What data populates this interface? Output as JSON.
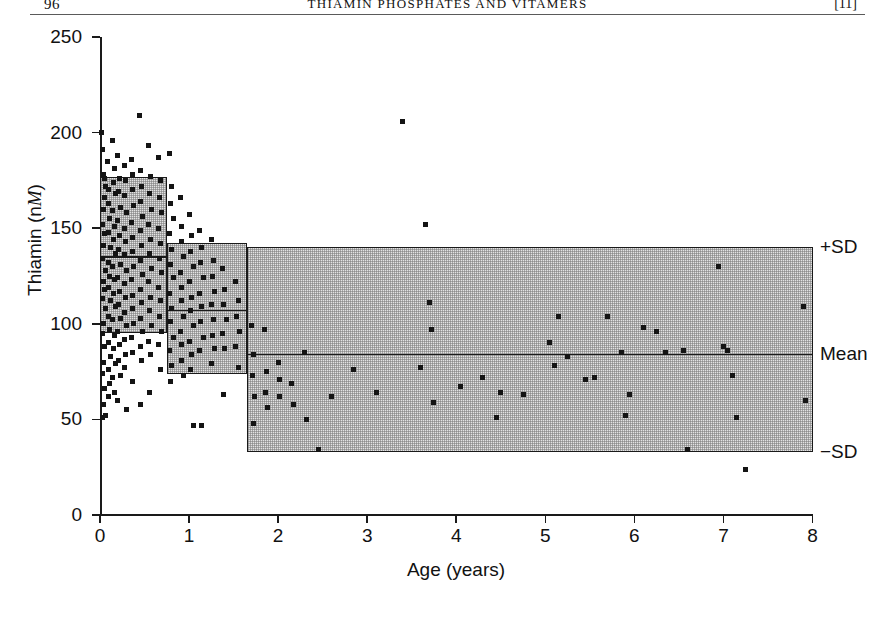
{
  "running_head": {
    "folio": "96",
    "title": "THIAMIN PHOSPHATES AND VITAMERS",
    "bracket": "[11]"
  },
  "chart_data": {
    "type": "scatter",
    "title": "",
    "xlabel": "Age (years)",
    "ylabel": "Thiamin (nM)",
    "ylabel_prefix": "Thiamin (n",
    "ylabel_italic": "M",
    "ylabel_suffix": ")",
    "xlim": [
      0,
      8
    ],
    "ylim": [
      0,
      250
    ],
    "xticks": [
      0,
      1,
      2,
      3,
      4,
      5,
      6,
      7,
      8
    ],
    "yticks": [
      0,
      50,
      100,
      150,
      200,
      250
    ],
    "xtick_labels": [
      "0",
      "1",
      "2",
      "3",
      "4",
      "5",
      "6",
      "7",
      "8"
    ],
    "ytick_labels": [
      "0",
      "50",
      "100",
      "150",
      "200",
      "250"
    ],
    "grid": false,
    "legend_position": "right-outside",
    "annotations": [
      {
        "label": "+SD",
        "y": 140
      },
      {
        "label": "Mean",
        "y": 84
      },
      {
        "label": "−SD",
        "y": 33
      }
    ],
    "reference_bands": [
      {
        "name": "band-0-to-0.75y",
        "x_start": 0.0,
        "x_end": 0.75,
        "plus_sd": 177,
        "mean": 135,
        "minus_sd": 95
      },
      {
        "name": "band-0.75-to-1.65y",
        "x_start": 0.75,
        "x_end": 1.65,
        "plus_sd": 142,
        "mean": 107,
        "minus_sd": 74
      },
      {
        "name": "band-1.65-to-8y",
        "x_start": 1.65,
        "x_end": 8.0,
        "plus_sd": 140,
        "mean": 84,
        "minus_sd": 33
      }
    ],
    "series": [
      {
        "name": "Thiamin concentration",
        "marker": "square",
        "color": "#141414",
        "points": [
          [
            0.02,
            200
          ],
          [
            0.03,
            191
          ],
          [
            0.04,
            178
          ],
          [
            0.05,
            176
          ],
          [
            0.06,
            172
          ],
          [
            0.05,
            166
          ],
          [
            0.04,
            160
          ],
          [
            0.03,
            152
          ],
          [
            0.05,
            147
          ],
          [
            0.04,
            141
          ],
          [
            0.03,
            134
          ],
          [
            0.06,
            128
          ],
          [
            0.04,
            122
          ],
          [
            0.05,
            118
          ],
          [
            0.03,
            113
          ],
          [
            0.06,
            108
          ],
          [
            0.04,
            100
          ],
          [
            0.03,
            95
          ],
          [
            0.05,
            88
          ],
          [
            0.04,
            80
          ],
          [
            0.03,
            74
          ],
          [
            0.05,
            66
          ],
          [
            0.04,
            58
          ],
          [
            0.06,
            52
          ],
          [
            0.03,
            51
          ],
          [
            0.08,
            185
          ],
          [
            0.09,
            170
          ],
          [
            0.1,
            163
          ],
          [
            0.11,
            155
          ],
          [
            0.09,
            148
          ],
          [
            0.12,
            140
          ],
          [
            0.1,
            132
          ],
          [
            0.11,
            125
          ],
          [
            0.09,
            119
          ],
          [
            0.12,
            112
          ],
          [
            0.1,
            104
          ],
          [
            0.11,
            97
          ],
          [
            0.09,
            90
          ],
          [
            0.12,
            83
          ],
          [
            0.1,
            76
          ],
          [
            0.11,
            69
          ],
          [
            0.09,
            62
          ],
          [
            0.14,
            196
          ],
          [
            0.16,
            181
          ],
          [
            0.15,
            174
          ],
          [
            0.17,
            168
          ],
          [
            0.14,
            159
          ],
          [
            0.16,
            151
          ],
          [
            0.15,
            144
          ],
          [
            0.17,
            137
          ],
          [
            0.14,
            130
          ],
          [
            0.16,
            123
          ],
          [
            0.15,
            116
          ],
          [
            0.17,
            109
          ],
          [
            0.14,
            102
          ],
          [
            0.16,
            94
          ],
          [
            0.15,
            87
          ],
          [
            0.17,
            79
          ],
          [
            0.14,
            72
          ],
          [
            0.16,
            64
          ],
          [
            0.2,
            188
          ],
          [
            0.22,
            176
          ],
          [
            0.21,
            169
          ],
          [
            0.23,
            161
          ],
          [
            0.2,
            154
          ],
          [
            0.22,
            146
          ],
          [
            0.21,
            139
          ],
          [
            0.23,
            131
          ],
          [
            0.2,
            124
          ],
          [
            0.22,
            117
          ],
          [
            0.21,
            110
          ],
          [
            0.23,
            103
          ],
          [
            0.2,
            96
          ],
          [
            0.22,
            89
          ],
          [
            0.21,
            81
          ],
          [
            0.23,
            73
          ],
          [
            0.2,
            60
          ],
          [
            0.27,
            183
          ],
          [
            0.29,
            175
          ],
          [
            0.28,
            167
          ],
          [
            0.3,
            158
          ],
          [
            0.27,
            150
          ],
          [
            0.29,
            143
          ],
          [
            0.28,
            136
          ],
          [
            0.3,
            128
          ],
          [
            0.27,
            121
          ],
          [
            0.29,
            114
          ],
          [
            0.28,
            106
          ],
          [
            0.3,
            99
          ],
          [
            0.27,
            92
          ],
          [
            0.29,
            84
          ],
          [
            0.28,
            77
          ],
          [
            0.3,
            55
          ],
          [
            0.35,
            186
          ],
          [
            0.37,
            178
          ],
          [
            0.36,
            170
          ],
          [
            0.38,
            162
          ],
          [
            0.35,
            153
          ],
          [
            0.37,
            145
          ],
          [
            0.36,
            138
          ],
          [
            0.38,
            130
          ],
          [
            0.35,
            123
          ],
          [
            0.37,
            115
          ],
          [
            0.36,
            108
          ],
          [
            0.38,
            100
          ],
          [
            0.35,
            93
          ],
          [
            0.37,
            85
          ],
          [
            0.36,
            70
          ],
          [
            0.44,
            209
          ],
          [
            0.45,
            180
          ],
          [
            0.47,
            172
          ],
          [
            0.46,
            164
          ],
          [
            0.48,
            156
          ],
          [
            0.45,
            149
          ],
          [
            0.47,
            141
          ],
          [
            0.46,
            133
          ],
          [
            0.48,
            126
          ],
          [
            0.45,
            118
          ],
          [
            0.47,
            111
          ],
          [
            0.46,
            103
          ],
          [
            0.48,
            96
          ],
          [
            0.45,
            88
          ],
          [
            0.47,
            81
          ],
          [
            0.46,
            58
          ],
          [
            0.55,
            193
          ],
          [
            0.57,
            177
          ],
          [
            0.56,
            168
          ],
          [
            0.58,
            160
          ],
          [
            0.55,
            152
          ],
          [
            0.57,
            144
          ],
          [
            0.56,
            137
          ],
          [
            0.58,
            129
          ],
          [
            0.55,
            122
          ],
          [
            0.57,
            114
          ],
          [
            0.56,
            107
          ],
          [
            0.58,
            99
          ],
          [
            0.55,
            91
          ],
          [
            0.57,
            84
          ],
          [
            0.56,
            64
          ],
          [
            0.66,
            187
          ],
          [
            0.68,
            175
          ],
          [
            0.67,
            166
          ],
          [
            0.69,
            158
          ],
          [
            0.66,
            150
          ],
          [
            0.68,
            142
          ],
          [
            0.67,
            134
          ],
          [
            0.69,
            127
          ],
          [
            0.66,
            119
          ],
          [
            0.68,
            112
          ],
          [
            0.67,
            104
          ],
          [
            0.69,
            96
          ],
          [
            0.66,
            89
          ],
          [
            0.68,
            76
          ],
          [
            0.78,
            189
          ],
          [
            0.8,
            172
          ],
          [
            0.79,
            163
          ],
          [
            0.82,
            155
          ],
          [
            0.78,
            147
          ],
          [
            0.8,
            139
          ],
          [
            0.79,
            131
          ],
          [
            0.82,
            124
          ],
          [
            0.78,
            116
          ],
          [
            0.8,
            108
          ],
          [
            0.79,
            101
          ],
          [
            0.82,
            93
          ],
          [
            0.78,
            86
          ],
          [
            0.8,
            78
          ],
          [
            0.79,
            70
          ],
          [
            0.9,
            166
          ],
          [
            0.92,
            151
          ],
          [
            0.91,
            143
          ],
          [
            0.94,
            135
          ],
          [
            0.9,
            127
          ],
          [
            0.92,
            119
          ],
          [
            0.91,
            112
          ],
          [
            0.94,
            104
          ],
          [
            0.9,
            96
          ],
          [
            0.92,
            89
          ],
          [
            0.91,
            81
          ],
          [
            0.94,
            73
          ],
          [
            1.0,
            157
          ],
          [
            1.03,
            146
          ],
          [
            1.02,
            138
          ],
          [
            1.05,
            130
          ],
          [
            1.0,
            122
          ],
          [
            1.03,
            114
          ],
          [
            1.02,
            107
          ],
          [
            1.05,
            99
          ],
          [
            1.0,
            91
          ],
          [
            1.03,
            84
          ],
          [
            1.02,
            76
          ],
          [
            1.05,
            47
          ],
          [
            1.12,
            149
          ],
          [
            1.14,
            140
          ],
          [
            1.13,
            132
          ],
          [
            1.16,
            124
          ],
          [
            1.12,
            116
          ],
          [
            1.14,
            109
          ],
          [
            1.13,
            101
          ],
          [
            1.16,
            93
          ],
          [
            1.12,
            86
          ],
          [
            1.14,
            47
          ],
          [
            1.25,
            144
          ],
          [
            1.27,
            133
          ],
          [
            1.26,
            125
          ],
          [
            1.29,
            117
          ],
          [
            1.25,
            110
          ],
          [
            1.27,
            102
          ],
          [
            1.26,
            94
          ],
          [
            1.29,
            87
          ],
          [
            1.25,
            79
          ],
          [
            1.38,
            129
          ],
          [
            1.4,
            118
          ],
          [
            1.39,
            110
          ],
          [
            1.42,
            102
          ],
          [
            1.38,
            95
          ],
          [
            1.4,
            87
          ],
          [
            1.39,
            63
          ],
          [
            1.52,
            122
          ],
          [
            1.55,
            112
          ],
          [
            1.53,
            104
          ],
          [
            1.57,
            96
          ],
          [
            1.52,
            88
          ],
          [
            1.55,
            77
          ],
          [
            1.7,
            99
          ],
          [
            1.72,
            84
          ],
          [
            1.71,
            73
          ],
          [
            1.73,
            62
          ],
          [
            1.72,
            48
          ],
          [
            1.85,
            97
          ],
          [
            1.87,
            75
          ],
          [
            1.86,
            64
          ],
          [
            1.88,
            56
          ],
          [
            2.0,
            80
          ],
          [
            2.02,
            71
          ],
          [
            2.01,
            62
          ],
          [
            2.15,
            69
          ],
          [
            2.17,
            58
          ],
          [
            2.3,
            85
          ],
          [
            2.32,
            50
          ],
          [
            2.45,
            34
          ],
          [
            2.6,
            62
          ],
          [
            2.85,
            76
          ],
          [
            3.1,
            64
          ],
          [
            3.4,
            206
          ],
          [
            3.6,
            77
          ],
          [
            3.65,
            152
          ],
          [
            3.7,
            111
          ],
          [
            3.72,
            97
          ],
          [
            3.75,
            59
          ],
          [
            4.05,
            67
          ],
          [
            4.3,
            72
          ],
          [
            4.45,
            51
          ],
          [
            4.5,
            64
          ],
          [
            4.75,
            63
          ],
          [
            5.05,
            90
          ],
          [
            5.1,
            78
          ],
          [
            5.15,
            104
          ],
          [
            5.25,
            83
          ],
          [
            5.45,
            71
          ],
          [
            5.55,
            72
          ],
          [
            5.7,
            104
          ],
          [
            5.85,
            85
          ],
          [
            5.9,
            52
          ],
          [
            5.95,
            63
          ],
          [
            6.1,
            98
          ],
          [
            6.25,
            96
          ],
          [
            6.35,
            85
          ],
          [
            6.55,
            86
          ],
          [
            6.6,
            34
          ],
          [
            6.95,
            130
          ],
          [
            7.0,
            88
          ],
          [
            7.05,
            86
          ],
          [
            7.1,
            73
          ],
          [
            7.15,
            51
          ],
          [
            7.25,
            24
          ],
          [
            7.9,
            109
          ],
          [
            7.92,
            60
          ]
        ]
      }
    ]
  }
}
